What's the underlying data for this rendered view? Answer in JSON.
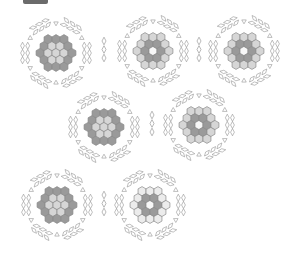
{
  "figure": {
    "background": "#ffffff",
    "stroke": "#8a8a8a",
    "tile_fill": "#ffffff",
    "top_tab": {
      "color": "#6b6b6b"
    }
  },
  "hex_radius": 4.6,
  "palette": {
    "dark": "#9a9a9a",
    "mid": "#b9b9b9",
    "light": "#d6d6d6",
    "pale": "#ececec",
    "white": "#f7f7f7"
  },
  "clusters": [
    {
      "id": "cluster-1",
      "cx": 56,
      "cy": 53,
      "center": "light",
      "inner": "light",
      "outer": "dark"
    },
    {
      "id": "cluster-2",
      "cx": 153,
      "cy": 51,
      "center": "white",
      "inner": "dark",
      "outer": "light"
    },
    {
      "id": "cluster-3",
      "cx": 244,
      "cy": 51,
      "center": "white",
      "inner": "dark",
      "outer": "light"
    },
    {
      "id": "cluster-4",
      "cx": 104,
      "cy": 127,
      "center": "light",
      "inner": "light",
      "outer": "dark"
    },
    {
      "id": "cluster-5",
      "cx": 199,
      "cy": 125,
      "center": "white",
      "inner": "dark",
      "outer": "light"
    },
    {
      "id": "cluster-6",
      "cx": 57,
      "cy": 205,
      "center": "light",
      "inner": "light",
      "outer": "dark"
    },
    {
      "id": "cluster-7",
      "cx": 150,
      "cy": 205,
      "center": "white",
      "inner": "dark",
      "outer": "pale"
    }
  ],
  "diamond_stacks": [
    {
      "id": "stack-1",
      "x": 104,
      "y": 41,
      "count": 3
    },
    {
      "id": "stack-2",
      "x": 199,
      "y": 41,
      "count": 3
    },
    {
      "id": "stack-3",
      "x": 152,
      "y": 115,
      "count": 3
    },
    {
      "id": "stack-4",
      "x": 104,
      "y": 195,
      "count": 3
    }
  ]
}
